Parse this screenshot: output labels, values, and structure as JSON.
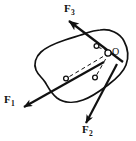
{
  "figure": {
    "type": "free-body-diagram",
    "background_color": "#ffffff",
    "stroke_color": "#111111",
    "canvas": {
      "width": 136,
      "height": 141
    },
    "body": {
      "name": "irregular-rigid-body",
      "label": "",
      "fill": "#ffffff",
      "stroke": "#111111",
      "stroke_width": 1.7
    },
    "point": {
      "name": "O",
      "label": "O",
      "x": 109,
      "y": 53,
      "marker": "open-circle",
      "marker_radius": 3
    },
    "vectors": [
      {
        "id": "F1",
        "label": "F",
        "subscript": "1",
        "application_point": {
          "x": 66,
          "y": 78,
          "marker": "open-circle"
        },
        "tail": {
          "x": 104,
          "y": 62
        },
        "tip": {
          "x": 20,
          "y": 109
        },
        "direction": "down-left",
        "arrowhead": "solid-filled",
        "stroke_width": 2.2
      },
      {
        "id": "F2",
        "label": "F",
        "subscript": "2",
        "application_point": {
          "x": 95,
          "y": 78,
          "marker": "open-circle"
        },
        "tail": {
          "x": 117,
          "y": 64
        },
        "tip": {
          "x": 85,
          "y": 126
        },
        "direction": "down-left",
        "arrowhead": "solid-filled",
        "stroke_width": 2.2
      },
      {
        "id": "F3",
        "label": "F",
        "subscript": "3",
        "application_point": {
          "x": 96,
          "y": 46,
          "marker": "open-circle"
        },
        "tail": {
          "x": 123,
          "y": 62
        },
        "tip": {
          "x": 66,
          "y": 19
        },
        "direction": "up-left",
        "arrowhead": "solid-filled",
        "stroke_width": 2.2
      }
    ],
    "dashed_connectors": [
      {
        "id": "O-to-F1-point",
        "from": {
          "x": 109,
          "y": 53
        },
        "to": {
          "x": 66,
          "y": 78
        },
        "style": "dashed",
        "dash_pattern": "4 3"
      },
      {
        "id": "O-to-F2-point",
        "from": {
          "x": 109,
          "y": 53
        },
        "to": {
          "x": 95,
          "y": 78
        },
        "style": "dashed",
        "dash_pattern": "4 3"
      },
      {
        "id": "O-to-F3-point",
        "from": {
          "x": 109,
          "y": 53
        },
        "to": {
          "x": 96,
          "y": 46
        },
        "style": "dashed",
        "dash_pattern": "4 3"
      }
    ],
    "labels": {
      "f1": {
        "base": "F",
        "sub": "1"
      },
      "f2": {
        "base": "F",
        "sub": "2"
      },
      "f3": {
        "base": "F",
        "sub": "3"
      },
      "o": "O"
    }
  }
}
